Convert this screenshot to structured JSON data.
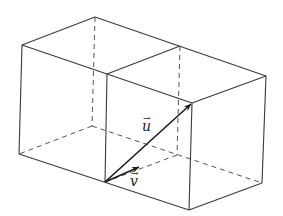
{
  "diagram": {
    "type": "3d-box-two-cubes",
    "vectors": [
      {
        "name": "u",
        "label": "u",
        "from": "front-bottom-middle vertex",
        "to": "back-top-right vertex of right cube face"
      },
      {
        "name": "v",
        "label": "v",
        "from": "front-bottom-middle vertex",
        "to": "short vector along bottom face"
      }
    ],
    "labels": {
      "u": "u",
      "v": "v",
      "arrow_accent": "→"
    },
    "colors": {
      "edge": "#3a3a3a",
      "hidden_edge": "#555555",
      "vector": "#1a1a1a",
      "background": "#ffffff"
    }
  }
}
